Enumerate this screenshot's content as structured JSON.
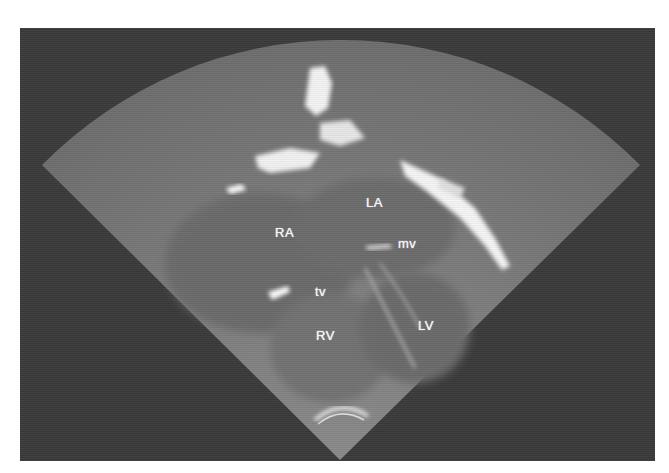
{
  "image": {
    "type": "echocardiogram-four-chamber-view",
    "background_color": "#3a3a3a",
    "sector_color": "#7a7a7a",
    "echo_bright_color": "#ffffff"
  },
  "labels": {
    "la": "LA",
    "ra": "RA",
    "mv": "mv",
    "tv": "tv",
    "rv": "RV",
    "lv": "LV"
  }
}
